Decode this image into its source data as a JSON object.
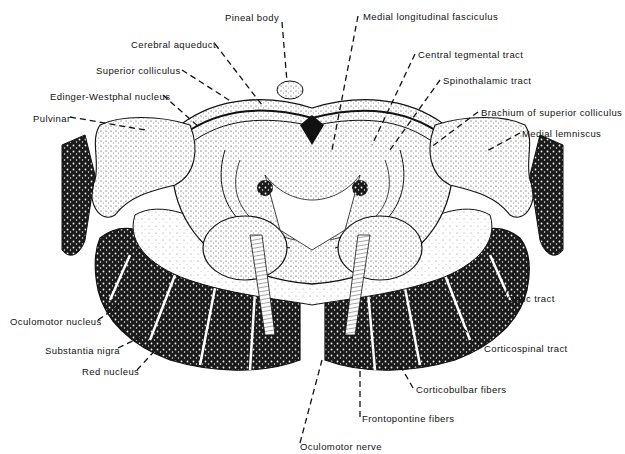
{
  "figure": {
    "colors": {
      "ink": "#111111",
      "background": "#ffffff",
      "stipple": "#333333"
    },
    "labels": [
      {
        "id": "pineal-body",
        "text": "Pineal body",
        "x": 225,
        "y": 18
      },
      {
        "id": "cerebral-aqueduct",
        "text": "Cerebral aqueduct",
        "x": 131,
        "y": 40
      },
      {
        "id": "superior-colliculus",
        "text": "Superior colliculus",
        "x": 96,
        "y": 66
      },
      {
        "id": "edinger-westphal-nucleus",
        "text": "Edinger-Westphal nucleus",
        "x": 50,
        "y": 92
      },
      {
        "id": "pulvinar",
        "text": "Pulvinar",
        "x": 33,
        "y": 113
      },
      {
        "id": "medial-longitudinal-fasciculus",
        "text": "Medial longitudinal fasciculus",
        "x": 363,
        "y": 11
      },
      {
        "id": "central-tegmental-tract",
        "text": "Central tegmental tract",
        "x": 418,
        "y": 49
      },
      {
        "id": "spinothalamic-tract",
        "text": "Spinothalamic tract",
        "x": 443,
        "y": 75
      },
      {
        "id": "brachium-of-superior-colliculus",
        "text": "Brachium of superior colliculus",
        "x": 481,
        "y": 108
      },
      {
        "id": "medial-lemniscus",
        "text": "Medial lemniscus",
        "x": 522,
        "y": 129
      },
      {
        "id": "optic-tract",
        "text": "Optic tract",
        "x": 507,
        "y": 293
      },
      {
        "id": "oculomotor-nucleus",
        "text": "Oculomotor nucleus",
        "x": 10,
        "y": 316
      },
      {
        "id": "substantia-nigra",
        "text": "Substantia nigra",
        "x": 45,
        "y": 345
      },
      {
        "id": "red-nucleus",
        "text": "Red nucleus",
        "x": 82,
        "y": 366
      },
      {
        "id": "corticospinal-tract",
        "text": "Corticospinal tract",
        "x": 484,
        "y": 343
      },
      {
        "id": "corticobulbar-fibers",
        "text": "Corticobulbar fibers",
        "x": 416,
        "y": 384
      },
      {
        "id": "frontopontine-fibers",
        "text": "Frontopontine fibers",
        "x": 362,
        "y": 413
      },
      {
        "id": "oculomotor-nerve",
        "text": "Oculomotor nerve",
        "x": 300,
        "y": 441
      }
    ]
  }
}
